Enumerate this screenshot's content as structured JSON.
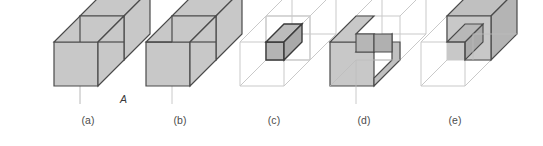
{
  "figure": {
    "background_color": "#ffffff",
    "solid_fill_color": "#c8c8c8",
    "solid_stroke_color": "#4a4a4a",
    "ghost_stroke_color": "#c9c9c9",
    "hidden_edge_color": "#a6a6a6",
    "intersection_fill_color": "#b4b4b4",
    "intersection_stroke_color": "#3a3a3a",
    "caption_color": "#4c4c4c",
    "label_color": "#3a3a3a"
  },
  "operand_labels": {
    "a": "A",
    "b": "B"
  },
  "panels": [
    {
      "key": "a",
      "caption": "(a)",
      "operation": "two overlapping cubes A and B",
      "left": 32
    },
    {
      "key": "b",
      "caption": "(b)",
      "operation": "union of A and B",
      "left": 124
    },
    {
      "key": "c",
      "caption": "(c)",
      "operation": "intersection of A and B",
      "left": 218
    },
    {
      "key": "d",
      "caption": "(d)",
      "operation": "A minus B",
      "left": 308
    },
    {
      "key": "e",
      "caption": "(e)",
      "operation": "B minus A",
      "left": 399
    }
  ]
}
